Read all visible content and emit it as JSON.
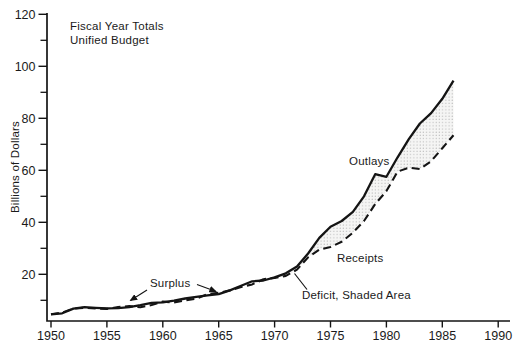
{
  "chart_data": {
    "type": "line",
    "title_lines": [
      "Fiscal Year Totals",
      "Unified Budget"
    ],
    "ylabel": "Billions of Dollars",
    "xlabel": "",
    "x_axis": {
      "ticks": [
        1950,
        1955,
        1960,
        1965,
        1970,
        1975,
        1980,
        1985,
        1990
      ],
      "range": [
        1950,
        1991
      ]
    },
    "y_axis": {
      "major_ticks": [
        20,
        40,
        60,
        80,
        100,
        120
      ],
      "minor_ticks": [
        10,
        30,
        50,
        70,
        90,
        110
      ],
      "range_top": 120,
      "grid": false
    },
    "years": [
      1950,
      1951,
      1952,
      1953,
      1954,
      1955,
      1956,
      1957,
      1958,
      1959,
      1960,
      1961,
      1962,
      1963,
      1964,
      1965,
      1966,
      1967,
      1968,
      1969,
      1970,
      1971,
      1972,
      1973,
      1974,
      1975,
      1976,
      1977,
      1978,
      1979,
      1980,
      1981,
      1982,
      1983,
      1984,
      1985,
      1986
    ],
    "series": [
      {
        "name": "Outlays",
        "style": "solid",
        "values": [
          4.6,
          5.0,
          6.8,
          7.4,
          7.1,
          6.9,
          7.0,
          7.4,
          8.1,
          9.0,
          9.2,
          9.9,
          10.7,
          11.3,
          11.9,
          12.4,
          13.8,
          15.6,
          17.3,
          17.6,
          18.8,
          20.4,
          23.0,
          28.0,
          34.0,
          38.3,
          40.5,
          44.0,
          50.0,
          58.5,
          57.5,
          65.0,
          72.0,
          78.0,
          82.0,
          87.5,
          94.5
        ]
      },
      {
        "name": "Receipts",
        "style": "dashed",
        "values": [
          4.6,
          5.3,
          6.8,
          7.1,
          6.9,
          6.7,
          7.4,
          7.8,
          7.3,
          8.2,
          9.5,
          9.2,
          10.0,
          10.6,
          12.4,
          12.9,
          13.8,
          15.1,
          16.1,
          18.1,
          18.6,
          19.4,
          21.8,
          26.5,
          29.5,
          30.5,
          32.5,
          36.0,
          40.5,
          47.0,
          52.0,
          59.5,
          61.0,
          60.5,
          63.5,
          68.5,
          73.5
        ]
      }
    ],
    "deficit_band": {
      "from_year": 1970,
      "to_year": 1986
    },
    "annotations": {
      "surplus_label": "Surplus",
      "outlays_label": "Outlays",
      "receipts_label": "Receipts",
      "deficit_label": "Deficit, Shaded Area"
    },
    "legend_position": "inline-annotations",
    "colors": {
      "line": "#141414",
      "background": "#ffffff",
      "shade_dot": "#ababab",
      "shade_bg": "#f5f5f4"
    }
  }
}
